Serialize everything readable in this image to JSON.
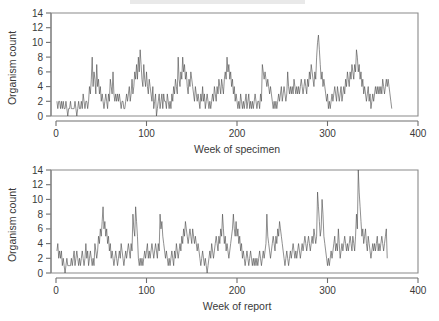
{
  "figure": {
    "background_color": "#ffffff",
    "line_color": "#4a4a4a",
    "axis_color": "#6e6e6e",
    "text_color": "#3a3a3a"
  },
  "panels": [
    {
      "name": "specimen-panel",
      "ylabel": "Organism count",
      "xlabel": "Week of specimen",
      "yticks": [
        "0",
        "2",
        "4",
        "6",
        "8",
        "10",
        "12",
        "14"
      ],
      "xticks": [
        "0",
        "100",
        "200",
        "300",
        "400"
      ]
    },
    {
      "name": "report-panel",
      "ylabel": "Organism count",
      "xlabel": "Week of report",
      "yticks": [
        "0",
        "2",
        "4",
        "6",
        "8",
        "10",
        "12",
        "14"
      ],
      "xticks": [
        "0",
        "100",
        "200",
        "300",
        "400"
      ]
    }
  ],
  "chart_data": [
    {
      "type": "line",
      "title": "",
      "xlabel": "Week of specimen",
      "ylabel": "Organism count",
      "xlim": [
        0,
        400
      ],
      "ylim": [
        0,
        14
      ],
      "xticks": [
        0,
        100,
        200,
        300,
        400
      ],
      "yticks": [
        0,
        2,
        4,
        6,
        8,
        10,
        12,
        14
      ],
      "grid": false,
      "legend": "none",
      "x_start": 1,
      "x_step": 1,
      "values": [
        2,
        1,
        2,
        2,
        1,
        2,
        1,
        2,
        1,
        1,
        2,
        1,
        0,
        1,
        1,
        2,
        1,
        1,
        1,
        1,
        2,
        1,
        0,
        1,
        2,
        1,
        1,
        2,
        1,
        3,
        2,
        1,
        2,
        2,
        1,
        2,
        4,
        3,
        5,
        8,
        4,
        6,
        5,
        3,
        7,
        4,
        5,
        3,
        4,
        2,
        3,
        2,
        1,
        2,
        3,
        2,
        1,
        3,
        2,
        5,
        4,
        3,
        6,
        3,
        2,
        3,
        2,
        3,
        2,
        3,
        2,
        1,
        2,
        2,
        1,
        1,
        2,
        3,
        2,
        3,
        4,
        2,
        3,
        5,
        3,
        4,
        6,
        5,
        7,
        5,
        8,
        6,
        9,
        7,
        5,
        4,
        7,
        5,
        4,
        6,
        4,
        3,
        5,
        4,
        3,
        2,
        4,
        1,
        2,
        3,
        0,
        1,
        2,
        3,
        1,
        2,
        3,
        1,
        3,
        2,
        2,
        1,
        3,
        2,
        1,
        2,
        1,
        3,
        2,
        4,
        3,
        5,
        4,
        3,
        8,
        5,
        4,
        6,
        5,
        8,
        6,
        7,
        5,
        6,
        4,
        3,
        5,
        4,
        6,
        5,
        4,
        3,
        2,
        4,
        3,
        2,
        3,
        2,
        1,
        3,
        2,
        4,
        2,
        3,
        1,
        2,
        3,
        2,
        1,
        2,
        1,
        2,
        3,
        2,
        4,
        3,
        2,
        4,
        3,
        5,
        4,
        3,
        5,
        4,
        3,
        5,
        6,
        5,
        8,
        6,
        7,
        5,
        6,
        4,
        5,
        3,
        4,
        2,
        3,
        2,
        1,
        2,
        1,
        3,
        2,
        1,
        2,
        1,
        2,
        3,
        1,
        2,
        3,
        1,
        2,
        1,
        2,
        1,
        2,
        3,
        2,
        1,
        2,
        2,
        1,
        3,
        2,
        7,
        6,
        5,
        6,
        5,
        4,
        5,
        4,
        3,
        4,
        3,
        2,
        1,
        2,
        1,
        2,
        1,
        2,
        3,
        2,
        3,
        4,
        2,
        3,
        4,
        3,
        2,
        3,
        6,
        4,
        3,
        4,
        3,
        4,
        3,
        5,
        4,
        3,
        4,
        3,
        4,
        3,
        4,
        5,
        4,
        3,
        4,
        5,
        4,
        3,
        5,
        4,
        6,
        5,
        7,
        6,
        5,
        4,
        6,
        5,
        8,
        10,
        11,
        9,
        7,
        5,
        6,
        4,
        5,
        4,
        3,
        2,
        3,
        1,
        2,
        1,
        2,
        3,
        2,
        3,
        4,
        3,
        2,
        4,
        3,
        2,
        3,
        4,
        2,
        3,
        4,
        3,
        5,
        4,
        6,
        5,
        4,
        6,
        5,
        7,
        6,
        5,
        7,
        6,
        9,
        8,
        6,
        7,
        5,
        6,
        4,
        5,
        3,
        4,
        3,
        2,
        3,
        4,
        2,
        3,
        1,
        2,
        3,
        2,
        3,
        4,
        3,
        4,
        3,
        4,
        3,
        4,
        3,
        5,
        4,
        3,
        4,
        5,
        4,
        5,
        4,
        3,
        2,
        1
      ]
    },
    {
      "type": "line",
      "title": "",
      "xlabel": "Week of report",
      "ylabel": "Organism count",
      "xlim": [
        0,
        400
      ],
      "ylim": [
        0,
        14
      ],
      "xticks": [
        0,
        100,
        200,
        300,
        400
      ],
      "yticks": [
        0,
        2,
        4,
        6,
        8,
        10,
        12,
        14
      ],
      "grid": false,
      "legend": "none",
      "x_start": 1,
      "x_step": 1,
      "values": [
        3,
        4,
        2,
        3,
        2,
        3,
        1,
        2,
        1,
        0,
        1,
        2,
        1,
        1,
        1,
        1,
        2,
        1,
        2,
        3,
        1,
        2,
        3,
        2,
        1,
        2,
        1,
        2,
        3,
        2,
        1,
        2,
        4,
        2,
        3,
        1,
        2,
        3,
        2,
        1,
        2,
        1,
        4,
        3,
        2,
        3,
        5,
        4,
        6,
        5,
        7,
        9,
        6,
        7,
        5,
        6,
        4,
        5,
        3,
        4,
        2,
        3,
        2,
        1,
        2,
        3,
        2,
        1,
        2,
        3,
        2,
        4,
        3,
        2,
        1,
        2,
        3,
        2,
        3,
        4,
        3,
        2,
        4,
        3,
        8,
        6,
        5,
        9,
        7,
        5,
        2,
        1,
        2,
        1,
        2,
        1,
        2,
        3,
        2,
        3,
        4,
        2,
        3,
        2,
        3,
        4,
        3,
        2,
        3,
        4,
        3,
        2,
        4,
        3,
        8,
        6,
        7,
        5,
        4,
        3,
        2,
        3,
        2,
        1,
        2,
        1,
        2,
        3,
        2,
        1,
        3,
        2,
        4,
        3,
        2,
        3,
        4,
        3,
        5,
        4,
        6,
        5,
        7,
        6,
        5,
        4,
        5,
        6,
        5,
        4,
        6,
        5,
        4,
        5,
        4,
        3,
        4,
        3,
        2,
        1,
        2,
        3,
        2,
        1,
        2,
        1,
        0,
        1,
        2,
        3,
        2,
        4,
        3,
        2,
        3,
        4,
        5,
        4,
        3,
        5,
        4,
        6,
        5,
        8,
        6,
        4,
        5,
        3,
        4,
        3,
        2,
        3,
        4,
        5,
        6,
        8,
        6,
        5,
        7,
        5,
        6,
        4,
        5,
        3,
        4,
        2,
        3,
        2,
        1,
        2,
        3,
        2,
        1,
        2,
        3,
        2,
        1,
        2,
        1,
        2,
        1,
        2,
        1,
        2,
        3,
        2,
        1,
        2,
        3,
        2,
        3,
        4,
        8,
        5,
        4,
        3,
        2,
        3,
        4,
        5,
        4,
        3,
        5,
        4,
        6,
        5,
        7,
        6,
        5,
        4,
        3,
        2,
        1,
        2,
        3,
        2,
        1,
        2,
        3,
        2,
        3,
        4,
        3,
        2,
        3,
        2,
        3,
        4,
        3,
        2,
        3,
        4,
        3,
        4,
        5,
        4,
        3,
        4,
        5,
        4,
        3,
        4,
        5,
        4,
        6,
        5,
        4,
        5,
        11,
        9,
        7,
        5,
        6,
        10,
        8,
        5,
        4,
        3,
        2,
        1,
        2,
        1,
        2,
        3,
        2,
        3,
        4,
        5,
        3,
        4,
        3,
        6,
        4,
        2,
        3,
        4,
        3,
        4,
        5,
        4,
        3,
        4,
        3,
        4,
        5,
        4,
        3,
        5,
        4,
        3,
        5,
        8,
        6,
        14,
        11,
        9,
        7,
        5,
        6,
        4,
        5,
        6,
        4,
        3,
        5,
        4,
        3,
        2,
        3,
        4,
        3,
        4,
        3,
        4,
        5,
        3,
        4,
        3,
        4,
        5,
        4,
        3,
        4,
        5,
        6,
        2
      ]
    }
  ]
}
